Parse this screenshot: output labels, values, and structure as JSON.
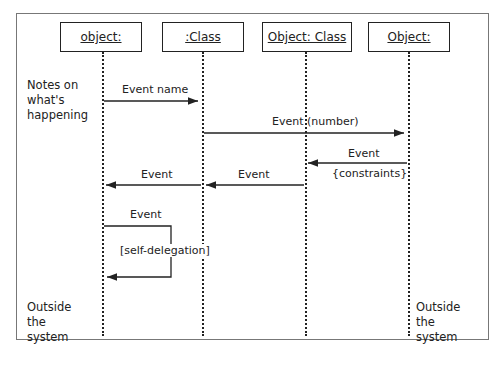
{
  "objects": [
    {
      "label": "object:"
    },
    {
      "label": ":Class"
    },
    {
      "label": "Object: Class"
    },
    {
      "label": "Object:"
    }
  ],
  "notes": {
    "left_top": "Notes on what's happening",
    "left_bottom": "Outside the system",
    "right_bottom": "Outside the system"
  },
  "messages": [
    {
      "label": "Event name",
      "from": "object:",
      "to": ":Class"
    },
    {
      "label": "Event (number)",
      "from": ":Class",
      "to": "Object:"
    },
    {
      "label": "Event",
      "sublabel": "{constraints}",
      "from": "Object:",
      "to": "Object: Class"
    },
    {
      "label": "Event",
      "from": "Object: Class",
      "to": ":Class"
    },
    {
      "label": "Event",
      "from": ":Class",
      "to": "object:"
    },
    {
      "label": "Event",
      "sublabel": "[self-delegation]",
      "from": "object:",
      "to": "object:"
    }
  ]
}
